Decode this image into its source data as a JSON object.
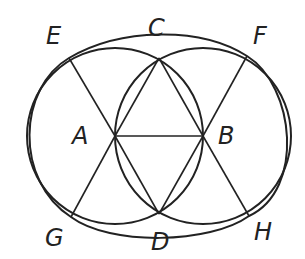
{
  "diagram": {
    "type": "geometric-construction",
    "stroke_color": "#222222",
    "background": "#ffffff",
    "points": {
      "A": {
        "label": "A",
        "x": 115,
        "y": 136
      },
      "B": {
        "label": "B",
        "x": 203,
        "y": 136
      },
      "C": {
        "label": "C",
        "x": 159,
        "y": 58
      },
      "D": {
        "label": "D",
        "x": 159,
        "y": 214
      },
      "E": {
        "label": "E",
        "x": 69,
        "y": 58
      },
      "F": {
        "label": "F",
        "x": 247,
        "y": 56
      },
      "G": {
        "label": "G",
        "x": 71,
        "y": 217
      },
      "H": {
        "label": "H",
        "x": 249,
        "y": 216
      }
    },
    "labels": [
      {
        "id": "E",
        "text": "E",
        "x": 46,
        "y": 24
      },
      {
        "id": "C",
        "text": "C",
        "x": 148,
        "y": 18
      },
      {
        "id": "F",
        "text": "F",
        "x": 253,
        "y": 24
      },
      {
        "id": "A",
        "text": "A",
        "x": 72,
        "y": 124
      },
      {
        "id": "B",
        "text": "B",
        "x": 218,
        "y": 124
      },
      {
        "id": "G",
        "text": "G",
        "x": 45,
        "y": 226
      },
      {
        "id": "D",
        "text": "D",
        "x": 151,
        "y": 230
      },
      {
        "id": "H",
        "text": "H",
        "x": 254,
        "y": 220
      }
    ],
    "segments": [
      "A-B",
      "A-C",
      "B-C",
      "A-D",
      "B-D",
      "A-E",
      "A-G",
      "B-F",
      "B-H"
    ],
    "circles": [
      "circle centered A through B",
      "circle centered B through A"
    ],
    "outer_curve": "oval through E, F, H, G"
  }
}
